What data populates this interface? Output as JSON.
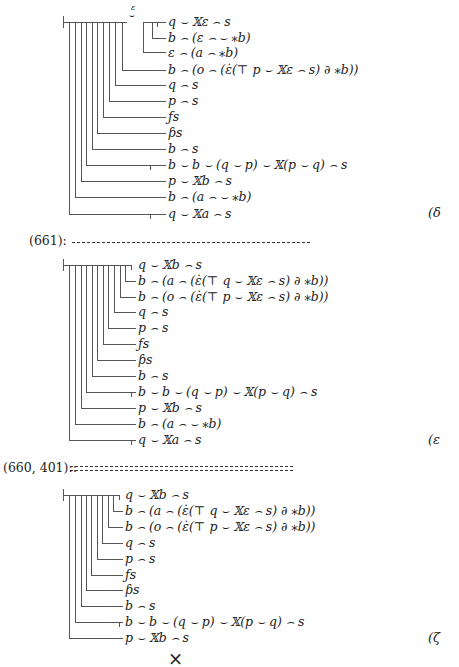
{
  "tree_delta": {
    "label": "(δ",
    "concavity_letter": "ɛ",
    "lines": [
      "q ⌣ 𝕏ɛ ⌢ s",
      "b ⌢ (ɛ ⌢ ⌣ ⁎b)",
      "ɛ ⌢ (a ⌢ ⁎b)",
      "b ⌢ (o ⌢ (ε̇(⊤ p ⌣ 𝕏ε ⌢ s) ∂ ⁎b))",
      "q ⌢ s",
      "p ⌢ s",
      "ƒs",
      "ƥs",
      "b ⌢ s",
      "b ⌣ b ⌣ (q ⌣ p) ⌣ 𝕏(p ⌣ q) ⌢ s",
      "p ⌣ 𝕏b ⌢ s",
      "b ⌢ (a ⌢ ⌣ ⁎b)",
      "q ⌣ 𝕏a ⌢ s"
    ]
  },
  "separator_1": {
    "ref": "(661):",
    "style": "dashed"
  },
  "tree_epsilon": {
    "label": "(ε",
    "lines": [
      "q ⌣ 𝕏b ⌢ s",
      "b ⌢ (a ⌢ (ε̇(⊤ q ⌣ 𝕏ε ⌢ s) ∂ ⁎b))",
      "b ⌢ (o ⌢ (ε̇(⊤ p ⌣ 𝕏ε ⌢ s) ∂ ⁎b))",
      "q ⌢ s",
      "p ⌢ s",
      "ƒs",
      "ƥs",
      "b ⌢ s",
      "b ⌣ b ⌣ (q ⌣ p) ⌣ 𝕏(p ⌣ q) ⌢ s",
      "p ⌣ 𝕏b ⌢ s",
      "b ⌢ (a ⌢ ⌣ ⁎b)",
      "q ⌣ 𝕏a ⌢ s"
    ]
  },
  "separator_2": {
    "ref": "(660, 401)::",
    "style": "double"
  },
  "tree_zeta": {
    "label": "(ζ",
    "lines": [
      "q ⌣ 𝕏b ⌢ s",
      "b ⌢ (a ⌢ (ε̇(⊤ q ⌣ 𝕏ε ⌢ s) ∂ ⁎b))",
      "b ⌢ (o ⌢ (ε̇(⊤ p ⌣ 𝕏ε ⌢ s) ∂ ⁎b))",
      "q ⌢ s",
      "p ⌢ s",
      "ƒs",
      "ƥs",
      "b ⌢ s",
      "b ⌣ b ⌣ (q ⌣ p) ⌣ 𝕏(p ⌣ q) ⌢ s",
      "p ⌣ 𝕏b ⌢ s"
    ]
  },
  "footer": {
    "symbol": "×"
  }
}
